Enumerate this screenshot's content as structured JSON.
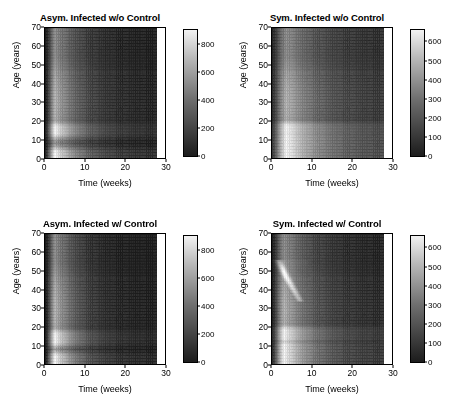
{
  "figure": {
    "background": "#ffffff",
    "colormap": "grayscale"
  },
  "axes": {
    "xlabel": "Time (weeks)",
    "ylabel": "Age (years)",
    "xticks": [
      0,
      10,
      20,
      30
    ],
    "yticks": [
      0,
      10,
      20,
      30,
      40,
      50,
      60,
      70
    ],
    "xlim": [
      0,
      30
    ],
    "ylim": [
      0,
      70
    ],
    "data_xmax": 28
  },
  "panels": [
    {
      "id": "asym-infected-wo-control",
      "title": "Asym. Infected w/o Control",
      "colorbar": {
        "ticks": [
          0,
          200,
          400,
          600,
          800
        ],
        "vmin": 0,
        "vmax": 900
      }
    },
    {
      "id": "sym-infected-wo-control",
      "title": "Sym. Infected w/o Control",
      "colorbar": {
        "ticks": [
          0,
          100,
          200,
          300,
          400,
          500,
          600
        ],
        "vmin": 0,
        "vmax": 660
      }
    },
    {
      "id": "asym-infected-w-control",
      "title": "Asym. Infected w/ Control",
      "colorbar": {
        "ticks": [
          0,
          200,
          400,
          600,
          800
        ],
        "vmin": 0,
        "vmax": 900
      }
    },
    {
      "id": "sym-infected-w-control",
      "title": "Sym. Infected w/ Control",
      "colorbar": {
        "ticks": [
          0,
          100,
          200,
          300,
          400,
          500,
          600
        ],
        "vmin": 0,
        "vmax": 660
      }
    }
  ],
  "chart_data": {
    "type": "heatmap",
    "xlabel": "Time (weeks)",
    "ylabel": "Age (years)",
    "xlim": [
      0,
      30
    ],
    "ylim": [
      0,
      70
    ],
    "grid": true,
    "legend_position": "right-colorbar",
    "panels": [
      {
        "title": "Asym. Infected w/o Control",
        "zlim": [
          0,
          900
        ],
        "colorbar_ticks": [
          0,
          200,
          400,
          600,
          800
        ],
        "peak_time_weeks": 2.5,
        "peak_value": 900,
        "features": {
          "early_bright_band_weeks": [
            1.5,
            5
          ],
          "bright_age_bands_years": [
            [
              0,
              3
            ],
            [
              13.5,
              16.5
            ]
          ],
          "decay_half_life_weeks": 4.5,
          "tail_value_at_week28": 120
        }
      },
      {
        "title": "Sym. Infected w/o Control",
        "zlim": [
          0,
          660
        ],
        "colorbar_ticks": [
          0,
          100,
          200,
          300,
          400,
          500,
          600
        ],
        "peak_time_weeks": 3.5,
        "peak_value": 660,
        "features": {
          "early_bright_band_weeks": [
            1.5,
            8
          ],
          "bright_age_bands_years": [
            [
              0,
              12
            ],
            [
              14,
              17
            ]
          ],
          "decay_half_life_weeks": 6.0,
          "tail_value_at_week28": 150
        }
      },
      {
        "title": "Asym. Infected w/ Control",
        "zlim": [
          0,
          900
        ],
        "colorbar_ticks": [
          0,
          200,
          400,
          600,
          800
        ],
        "peak_time_weeks": 2.5,
        "peak_value": 880,
        "features": {
          "early_bright_band_weeks": [
            1.5,
            5.5
          ],
          "bright_age_bands_years": [
            [
              0,
              4
            ],
            [
              12,
              16
            ]
          ],
          "decay_half_life_weeks": 4.0,
          "tail_value_at_week28": 100
        }
      },
      {
        "title": "Sym. Infected w/ Control",
        "zlim": [
          0,
          660
        ],
        "colorbar_ticks": [
          0,
          100,
          200,
          300,
          400,
          500,
          600
        ],
        "peak_time_weeks": 3.0,
        "peak_value": 660,
        "features": {
          "early_bright_band_weeks": [
            1.5,
            7
          ],
          "bright_age_bands_years": [
            [
              0,
              10
            ],
            [
              14,
              18
            ]
          ],
          "diagonal_streak": {
            "from_age": 55,
            "from_week": 1.5,
            "to_age": 38,
            "to_week": 6
          },
          "decay_half_life_weeks": 5.0,
          "tail_value_at_week28": 110
        }
      }
    ]
  }
}
